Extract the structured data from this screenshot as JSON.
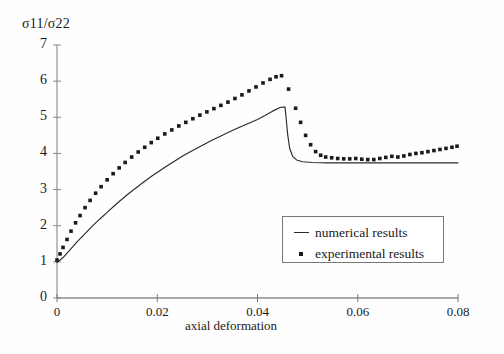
{
  "chart_data": {
    "type": "line",
    "title": "",
    "ylabel": "σ11/σ22",
    "xlabel": "axial deformation",
    "xlim": [
      0,
      0.08
    ],
    "ylim": [
      0,
      7
    ],
    "xticks": [
      "0",
      "0.02",
      "0.04",
      "0.06",
      "0.08"
    ],
    "xtick_values": [
      0,
      0.02,
      0.04,
      0.06,
      0.08
    ],
    "yticks": [
      "0",
      "1",
      "2",
      "3",
      "4",
      "5",
      "6",
      "7"
    ],
    "ytick_values": [
      0,
      1,
      2,
      3,
      4,
      5,
      6,
      7
    ],
    "grid": false,
    "legend_position": "lower-right-inside",
    "series": [
      {
        "name": "numerical results",
        "style": "line",
        "color": "#2b2b2b",
        "x": [
          0.0,
          0.0012,
          0.0025,
          0.004,
          0.0055,
          0.007,
          0.0085,
          0.01,
          0.0115,
          0.013,
          0.0145,
          0.016,
          0.0175,
          0.019,
          0.0205,
          0.022,
          0.0235,
          0.025,
          0.0265,
          0.028,
          0.0295,
          0.031,
          0.0325,
          0.034,
          0.0355,
          0.037,
          0.0385,
          0.04,
          0.0415,
          0.043,
          0.0445,
          0.0452,
          0.0455,
          0.0457,
          0.046,
          0.0464,
          0.047,
          0.0478,
          0.049,
          0.051,
          0.054,
          0.058,
          0.062,
          0.066,
          0.07,
          0.074,
          0.078,
          0.08
        ],
        "y": [
          0.98,
          1.12,
          1.32,
          1.55,
          1.77,
          1.98,
          2.18,
          2.37,
          2.56,
          2.74,
          2.91,
          3.07,
          3.23,
          3.38,
          3.52,
          3.66,
          3.79,
          3.92,
          4.04,
          4.15,
          4.26,
          4.37,
          4.47,
          4.57,
          4.67,
          4.76,
          4.85,
          4.94,
          5.05,
          5.17,
          5.27,
          5.28,
          5.28,
          5.0,
          4.55,
          4.15,
          3.92,
          3.82,
          3.77,
          3.75,
          3.74,
          3.74,
          3.74,
          3.74,
          3.74,
          3.74,
          3.74,
          3.74
        ]
      },
      {
        "name": "experimental results",
        "style": "dots",
        "color": "#1a1a1a",
        "x": [
          0.0,
          0.0006,
          0.0012,
          0.002,
          0.0028,
          0.0037,
          0.0046,
          0.0056,
          0.0066,
          0.0077,
          0.0088,
          0.01,
          0.0112,
          0.0124,
          0.0136,
          0.0149,
          0.0162,
          0.0175,
          0.0188,
          0.0201,
          0.0215,
          0.0229,
          0.0243,
          0.0257,
          0.0271,
          0.0285,
          0.0299,
          0.0313,
          0.0327,
          0.0341,
          0.0355,
          0.0369,
          0.0383,
          0.0397,
          0.0411,
          0.0425,
          0.0437,
          0.0448,
          0.0462,
          0.0476,
          0.0486,
          0.0496,
          0.0506,
          0.0516,
          0.0526,
          0.0536,
          0.0548,
          0.056,
          0.0572,
          0.0584,
          0.0596,
          0.0608,
          0.062,
          0.0632,
          0.0644,
          0.0656,
          0.0668,
          0.068,
          0.0692,
          0.0704,
          0.0716,
          0.0728,
          0.074,
          0.0752,
          0.0764,
          0.0776,
          0.0788,
          0.0798
        ],
        "y": [
          1.05,
          1.22,
          1.4,
          1.62,
          1.85,
          2.08,
          2.28,
          2.5,
          2.7,
          2.9,
          3.08,
          3.27,
          3.44,
          3.6,
          3.75,
          3.9,
          4.04,
          4.17,
          4.3,
          4.42,
          4.54,
          4.65,
          4.76,
          4.86,
          4.96,
          5.06,
          5.15,
          5.24,
          5.33,
          5.42,
          5.52,
          5.62,
          5.73,
          5.84,
          5.95,
          6.05,
          6.12,
          6.15,
          5.78,
          5.25,
          4.86,
          4.5,
          4.24,
          4.05,
          3.95,
          3.9,
          3.88,
          3.86,
          3.85,
          3.85,
          3.86,
          3.84,
          3.83,
          3.83,
          3.86,
          3.89,
          3.92,
          3.9,
          3.93,
          3.97,
          4.0,
          4.02,
          4.05,
          4.08,
          4.11,
          4.14,
          4.17,
          4.2
        ]
      }
    ]
  },
  "legend": {
    "entries": [
      {
        "label": "numerical results",
        "marker": "line"
      },
      {
        "label": "experimental results",
        "marker": "dot"
      }
    ]
  }
}
